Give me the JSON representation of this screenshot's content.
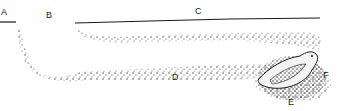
{
  "diagram": {
    "type": "burrow cross-section",
    "labels": [
      {
        "id": "A",
        "text": "A",
        "x": 1,
        "y": 8
      },
      {
        "id": "B",
        "text": "B",
        "x": 46,
        "y": 11
      },
      {
        "id": "C",
        "text": "C",
        "x": 195,
        "y": 7
      },
      {
        "id": "D",
        "text": "D",
        "x": 172,
        "y": 73
      },
      {
        "id": "E",
        "text": "E",
        "x": 288,
        "y": 98
      },
      {
        "id": "F",
        "text": "F",
        "x": 323,
        "y": 71
      }
    ],
    "colors": {
      "ink": "#1a1a1a",
      "background": "#ffffff"
    }
  }
}
